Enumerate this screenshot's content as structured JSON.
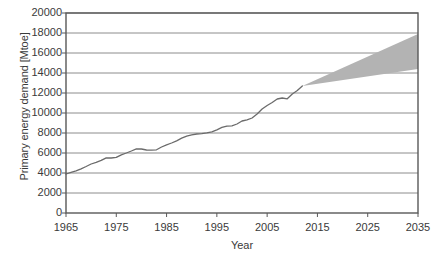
{
  "chart_data": {
    "type": "line",
    "title": "",
    "subtitle": "",
    "xlabel": "Year",
    "ylabel": "Primary energy demand [Mtoe]",
    "xlim": [
      1965,
      2035
    ],
    "ylim": [
      0,
      20000
    ],
    "grid": "horizontal",
    "legend": "none",
    "x_ticks": [
      1965,
      1975,
      1985,
      1995,
      2005,
      2015,
      2025,
      2035
    ],
    "x_tick_labels": [
      "1965",
      "1975",
      "1985",
      "1995",
      "2005",
      "2015",
      "2025",
      "2035"
    ],
    "y_ticks": [
      0,
      2000,
      4000,
      6000,
      8000,
      10000,
      12000,
      14000,
      16000,
      18000,
      20000
    ],
    "y_tick_labels": [
      "0",
      "2000",
      "4000",
      "6000",
      "8000",
      "10000",
      "12000",
      "14000",
      "16000",
      "18000",
      "20000"
    ],
    "line_color": "#6b6b6b",
    "band_color": "#b3b3b3",
    "axis_color": "#595959",
    "grid_color": "#8c8c8c",
    "background_color": "#ffffff",
    "series": [
      {
        "name": "Historical primary energy demand",
        "type": "line",
        "x": [
          1965,
          1966,
          1967,
          1968,
          1969,
          1970,
          1971,
          1972,
          1973,
          1974,
          1975,
          1976,
          1977,
          1978,
          1979,
          1980,
          1981,
          1982,
          1983,
          1984,
          1985,
          1986,
          1987,
          1988,
          1989,
          1990,
          1991,
          1992,
          1993,
          1994,
          1995,
          1996,
          1997,
          1998,
          1999,
          2000,
          2001,
          2002,
          2003,
          2004,
          2005,
          2006,
          2007,
          2008,
          2009,
          2010,
          2011,
          2012
        ],
        "values": [
          3900,
          4060,
          4220,
          4420,
          4650,
          4900,
          5060,
          5260,
          5520,
          5500,
          5560,
          5820,
          6000,
          6200,
          6420,
          6400,
          6300,
          6280,
          6320,
          6600,
          6820,
          7000,
          7220,
          7480,
          7680,
          7820,
          7900,
          7940,
          8020,
          8120,
          8320,
          8560,
          8680,
          8720,
          8900,
          9200,
          9320,
          9500,
          9900,
          10400,
          10750,
          11050,
          11400,
          11500,
          11420,
          11900,
          12250,
          12700
        ]
      },
      {
        "name": "Projection range (high)",
        "type": "band-upper",
        "x": [
          2012,
          2035
        ],
        "values": [
          12700,
          17900
        ]
      },
      {
        "name": "Projection range (low)",
        "type": "band-lower",
        "x": [
          2012,
          2035
        ],
        "values": [
          12700,
          14400
        ]
      }
    ],
    "annotations": [
      {
        "text": "Shaded area shows projected range of future primary energy demand from 2012 to 2035",
        "kind": "shaded-band"
      }
    ]
  }
}
